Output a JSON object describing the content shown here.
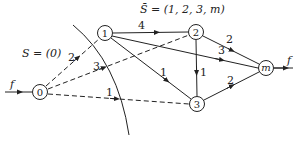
{
  "diagram": {
    "type": "network-flow-cut",
    "set_labels": {
      "S": "S = (0)",
      "S_bar": "S̄ = (1, 2, 3, m)"
    },
    "nodes": [
      {
        "id": "0",
        "label": "0",
        "x": 40,
        "y": 92
      },
      {
        "id": "1",
        "label": "1",
        "x": 105,
        "y": 33
      },
      {
        "id": "2",
        "label": "2",
        "x": 196,
        "y": 32
      },
      {
        "id": "3",
        "label": "3",
        "x": 197,
        "y": 104
      },
      {
        "id": "m",
        "label": "m",
        "x": 266,
        "y": 68
      }
    ],
    "edges": [
      {
        "from": "0",
        "to": "1",
        "capacity": "2",
        "style": "dashed"
      },
      {
        "from": "0",
        "to": "2",
        "capacity": "3",
        "style": "dashed"
      },
      {
        "from": "0",
        "to": "3",
        "capacity": "1",
        "style": "dashed"
      },
      {
        "from": "1",
        "to": "2",
        "capacity": "4",
        "style": "solid"
      },
      {
        "from": "1",
        "to": "m",
        "capacity": "3",
        "style": "solid"
      },
      {
        "from": "1",
        "to": "3",
        "capacity": "1",
        "style": "solid"
      },
      {
        "from": "2",
        "to": "m",
        "capacity": "2",
        "style": "solid"
      },
      {
        "from": "2",
        "to": "3",
        "capacity": "1",
        "style": "solid"
      },
      {
        "from": "3",
        "to": "m",
        "capacity": "2",
        "style": "solid"
      }
    ],
    "flow_in_label": "f",
    "flow_out_label": "f",
    "edge_labels": {
      "e01": "2",
      "e02": "3",
      "e03": "1",
      "e12": "4",
      "e1m": "3",
      "e13": "1",
      "e2m": "2",
      "e23": "1",
      "e3m": "2"
    }
  }
}
